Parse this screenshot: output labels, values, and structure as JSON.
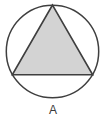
{
  "figure": {
    "label": "A",
    "background": "#ffffff",
    "circle_stroke": "#3f3f3f",
    "triangle_fill": "#d3d3d3",
    "triangle_stroke": "#3f3f3f",
    "label_color": "#3a3a3a"
  }
}
